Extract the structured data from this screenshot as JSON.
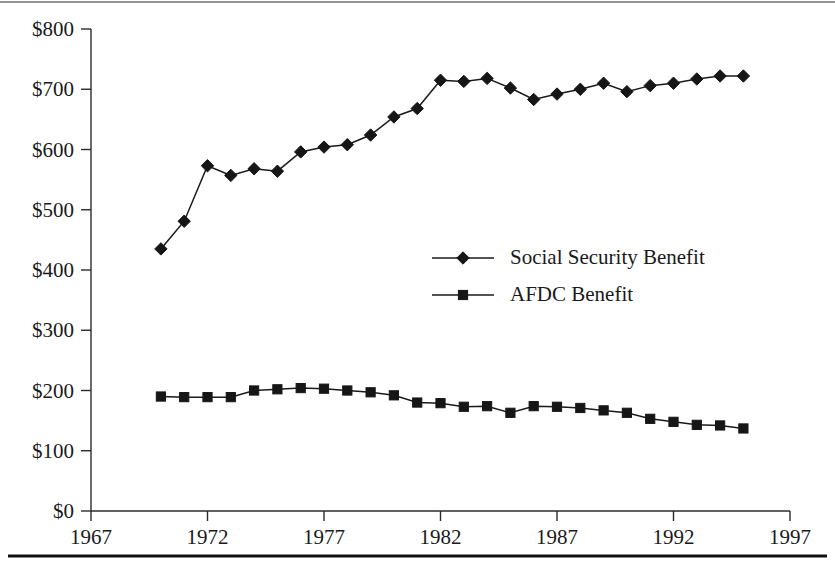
{
  "chart_data": {
    "type": "line",
    "title": "",
    "subtitle": "",
    "xlabel": "",
    "ylabel": "",
    "xlim": [
      1967,
      1997
    ],
    "ylim": [
      0,
      800
    ],
    "grid": false,
    "legend_position": "center-right",
    "x_tick_labels": [
      "1967",
      "1972",
      "1977",
      "1982",
      "1987",
      "1992",
      "1997"
    ],
    "x_ticks": [
      1967,
      1972,
      1977,
      1982,
      1987,
      1992,
      1997
    ],
    "y_tick_labels": [
      "$0",
      "$100",
      "$200",
      "$300",
      "$400",
      "$500",
      "$600",
      "$700",
      "$800"
    ],
    "y_ticks": [
      0,
      100,
      200,
      300,
      400,
      500,
      600,
      700,
      800
    ],
    "x": [
      1970,
      1971,
      1972,
      1973,
      1974,
      1975,
      1976,
      1977,
      1978,
      1979,
      1980,
      1981,
      1982,
      1983,
      1984,
      1985,
      1986,
      1987,
      1988,
      1989,
      1990,
      1991,
      1992,
      1993,
      1994,
      1995
    ],
    "series": [
      {
        "name": "Social Security Benefit",
        "marker": "diamond",
        "color": "#161616",
        "values": [
          435,
          481,
          573,
          557,
          568,
          564,
          596,
          604,
          608,
          624,
          654,
          668,
          715,
          713,
          718,
          702,
          683,
          692,
          700,
          710,
          696,
          706,
          710,
          717,
          722,
          722
        ]
      },
      {
        "name": "AFDC Benefit",
        "marker": "square",
        "color": "#161616",
        "values": [
          190,
          189,
          189,
          189,
          200,
          202,
          204,
          203,
          200,
          197,
          192,
          180,
          179,
          173,
          174,
          163,
          174,
          173,
          171,
          167,
          163,
          153,
          148,
          143,
          142,
          137
        ]
      }
    ]
  },
  "legend": {
    "entries": [
      {
        "label": "Social Security Benefit",
        "marker": "diamond"
      },
      {
        "label": "AFDC Benefit",
        "marker": "square"
      }
    ]
  }
}
